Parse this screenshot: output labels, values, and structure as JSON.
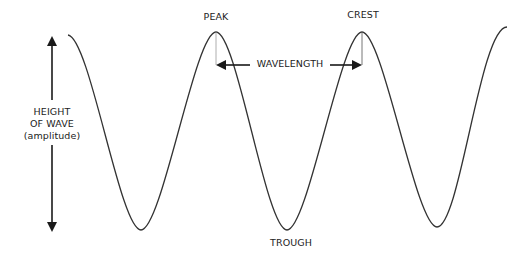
{
  "diagram": {
    "labels": {
      "amplitude_line1": "HEIGHT",
      "amplitude_line2": "OF WAVE",
      "amplitude_line3": "(amplitude)",
      "peak": "PEAK",
      "crest": "CREST",
      "trough": "TROUGH",
      "wavelength": "WAVELENGTH"
    },
    "colors": {
      "background": "#ffffff",
      "wave_stroke": "#333333",
      "arrow": "#1a1a1a",
      "guide_line": "#999999",
      "text": "#222222"
    },
    "wave": {
      "type": "sinusoid",
      "start_x": 68,
      "end_x": 507,
      "crest_y": 32,
      "trough_y": 230,
      "period_px": 146,
      "peaks_x": [
        216,
        362
      ],
      "troughs_x": [
        141,
        287,
        437
      ]
    }
  }
}
